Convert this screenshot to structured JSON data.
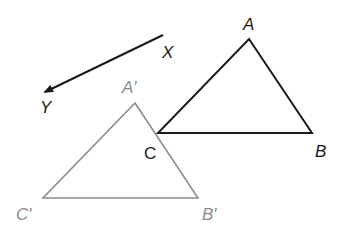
{
  "colors": {
    "original": "#1a1a1a",
    "image": "#8c8c8c",
    "background": "#ffffff"
  },
  "vector": {
    "start_label": "X",
    "end_label": "Y",
    "start": [
      163,
      35
    ],
    "end": [
      43,
      93
    ]
  },
  "original_triangle": {
    "vertices": [
      {
        "name": "A",
        "label": "A",
        "point": [
          249,
          39
        ],
        "label_pos": [
          249,
          30
        ]
      },
      {
        "name": "B",
        "label": "B",
        "point": [
          312,
          133
        ],
        "label_pos": [
          322,
          157
        ]
      },
      {
        "name": "C",
        "label": "C",
        "point": [
          158,
          133
        ],
        "label_pos": [
          151,
          159
        ]
      }
    ]
  },
  "image_triangle": {
    "vertices": [
      {
        "name": "A'",
        "label": "A′",
        "point": [
          135,
          103
        ],
        "label_pos": [
          133,
          93
        ]
      },
      {
        "name": "B'",
        "label": "B′",
        "point": [
          198,
          198
        ],
        "label_pos": [
          210,
          220
        ]
      },
      {
        "name": "C'",
        "label": "C′",
        "point": [
          43,
          198
        ],
        "label_pos": [
          27,
          220
        ]
      }
    ]
  }
}
